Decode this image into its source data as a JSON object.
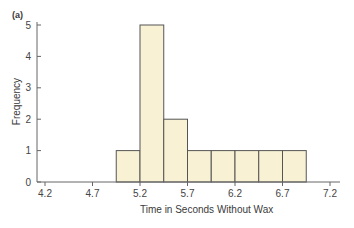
{
  "chart_data": {
    "type": "bar",
    "panel_label": "(a)",
    "title": "",
    "xlabel": "Time in Seconds Without Wax",
    "ylabel": "Frequency",
    "bin_width": 0.25,
    "bins": [
      {
        "start": 4.95,
        "end": 5.2,
        "value": 1
      },
      {
        "start": 5.2,
        "end": 5.45,
        "value": 5
      },
      {
        "start": 5.45,
        "end": 5.7,
        "value": 2
      },
      {
        "start": 5.7,
        "end": 5.95,
        "value": 1
      },
      {
        "start": 5.95,
        "end": 6.2,
        "value": 1
      },
      {
        "start": 6.2,
        "end": 6.45,
        "value": 1
      },
      {
        "start": 6.45,
        "end": 6.7,
        "value": 1
      },
      {
        "start": 6.7,
        "end": 6.95,
        "value": 1
      }
    ],
    "xticks": [
      "4.2",
      "4.7",
      "5.2",
      "5.7",
      "6.2",
      "6.7",
      "7.2"
    ],
    "yticks": [
      "0",
      "1",
      "2",
      "3",
      "4",
      "5"
    ],
    "xlim": [
      4.1,
      7.3
    ],
    "ylim": [
      0,
      5.2
    ],
    "grid": false,
    "bar_color": "#f8f1d4",
    "edge_color": "#555555"
  }
}
